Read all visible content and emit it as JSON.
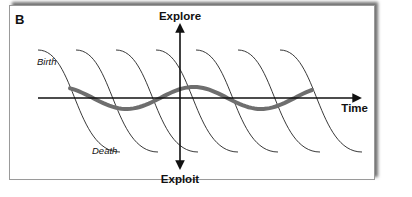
{
  "panel": {
    "label": "B"
  },
  "axes": {
    "vertical_top_label": "Explore",
    "vertical_bottom_label": "Exploit",
    "horizontal_label": "Time"
  },
  "annotations": {
    "birth": "Birth",
    "death": "Death"
  },
  "curves": {
    "sigmoid_count": 7,
    "sigmoid_starts_x": [
      38,
      76,
      116,
      156,
      196,
      238,
      280
    ],
    "sigmoid_width": 82,
    "sigmoid_top_y": 50,
    "sigmoid_bottom_y": 152,
    "wave": {
      "start_x": 70,
      "end_x": 312,
      "center_y": 98,
      "amplitude": 11,
      "color": "#6e6e6e"
    },
    "line_color": "#222222"
  }
}
